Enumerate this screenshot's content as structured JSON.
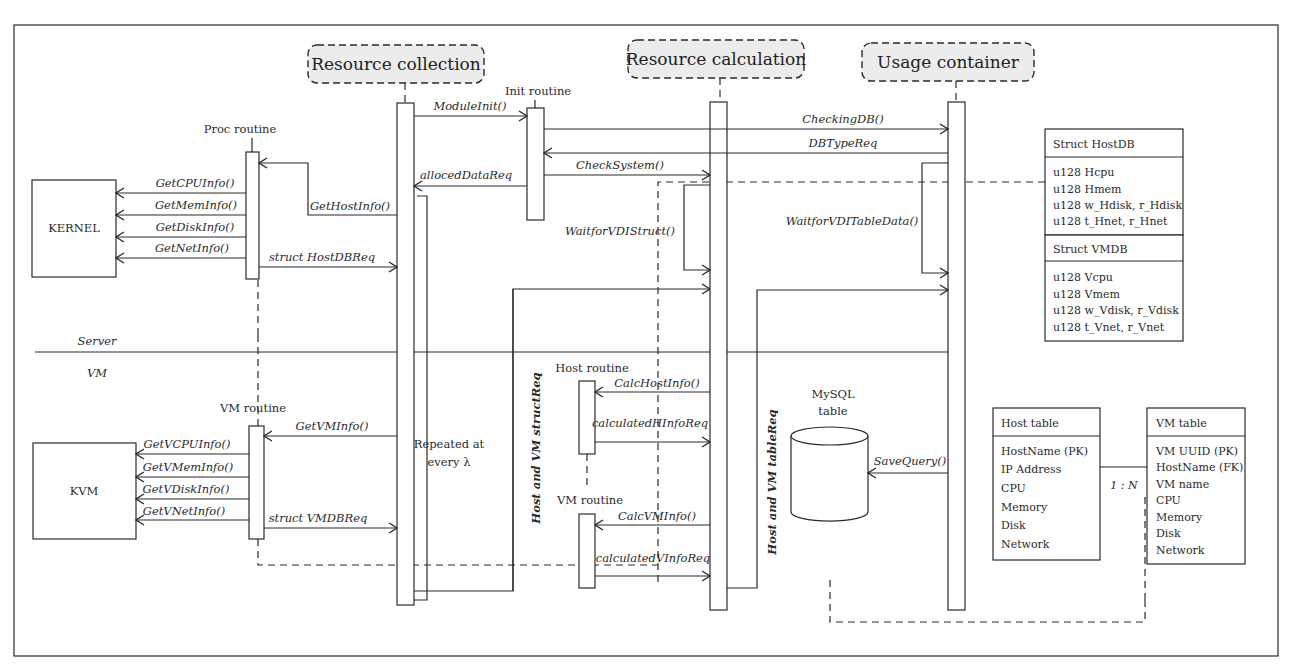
{
  "participants": {
    "resource_collection": "Resource collection",
    "resource_calculation": "Resource calculation",
    "usage_container": "Usage container"
  },
  "routines": {
    "init": "Init routine",
    "proc": "Proc routine",
    "vm_top": "VM routine",
    "host": "Host routine",
    "vm_calc": "VM routine"
  },
  "entities": {
    "kernel": "KERNEL",
    "kvm": "KVM",
    "mysql_line1": "MySQL",
    "mysql_line2": "table"
  },
  "zones": {
    "server": "Server",
    "vm": "VM"
  },
  "messages": {
    "module_init": "ModuleInit()",
    "checking_db": "CheckingDB()",
    "db_type_req": "DBTypeReq",
    "check_system": "CheckSystem()",
    "alloced_data_req": "allocedDataReq",
    "get_host_info": "GetHostInfo()",
    "get_cpu_info": "GetCPUInfo()",
    "get_mem_info": "GetMemInfo()",
    "get_disk_info": "GetDiskInfo()",
    "get_net_info": "GetNetInfo()",
    "struct_hostdb_req": "struct HostDBReq",
    "waitfor_vdi_struct": "WaitforVDIStruct()",
    "waitfor_vdi_table_data": "WaitforVDITableData()",
    "get_vm_info": "GetVMInfo()",
    "get_vcpu_info": "GetVCPUInfo()",
    "get_vmem_info": "GetVMemInfo()",
    "get_vdisk_info": "GetVDiskInfo()",
    "get_vnet_info": "GetVNetInfo()",
    "struct_vmdb_req": "struct VMDBReq",
    "calc_host_info": "CalcHostInfo()",
    "calculated_hinfo_req": "calculatedHInfoReq",
    "calc_vm_info": "CalcVMInfo()",
    "calculated_vinfo_req": "calculatedVInfoReq",
    "save_query": "SaveQuery()",
    "host_vm_struct_req": "Host and VM structReq",
    "host_vm_table_req": "Host and VM tableReq",
    "repeated_line1": "Repeated at",
    "repeated_line2": "every λ"
  },
  "structs": {
    "hostdb": {
      "title": "Struct HostDB",
      "fields": [
        "u128 Hcpu",
        "u128 Hmem",
        "u128 w_Hdisk, r_Hdisk",
        "u128 t_Hnet, r_Hnet"
      ]
    },
    "vmdb": {
      "title": "Struct VMDB",
      "fields": [
        "u128 Vcpu",
        "u128 Vmem",
        "u128 w_Vdisk, r_Vdisk",
        "u128 t_Vnet, r_Vnet"
      ]
    }
  },
  "tables": {
    "host": {
      "title": "Host table",
      "fields": [
        "HostName (PK)",
        "IP Address",
        "CPU",
        "Memory",
        "Disk",
        "Network"
      ]
    },
    "vm": {
      "title": "VM table",
      "fields": [
        "VM UUID (PK)",
        "HostName (FK)",
        "VM name",
        "CPU",
        "Memory",
        "Disk",
        "Network"
      ]
    },
    "relation": "1 : N"
  }
}
